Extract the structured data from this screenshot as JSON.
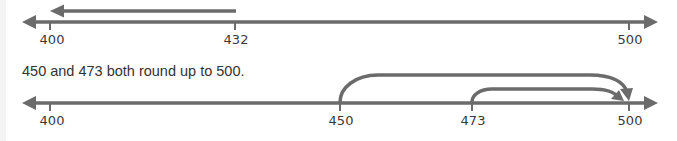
{
  "colors": {
    "line": "#6b6b6b",
    "text": "#333333",
    "label": "#3a3a3a"
  },
  "top_number_line": {
    "ticks": [
      {
        "value": "400",
        "x": 50
      },
      {
        "value": "432",
        "x": 235
      },
      {
        "value": "500",
        "x": 629
      }
    ],
    "jump_arrow": {
      "from": "432",
      "to": "400",
      "direction": "left"
    }
  },
  "caption": "450 and 473 both round up to 500.",
  "bottom_number_line": {
    "ticks": [
      {
        "value": "400",
        "x": 50
      },
      {
        "value": "450",
        "x": 340
      },
      {
        "value": "473",
        "x": 472
      },
      {
        "value": "500",
        "x": 629
      }
    ],
    "jump_arrows": [
      {
        "from": "450",
        "to": "500"
      },
      {
        "from": "473",
        "to": "500"
      }
    ]
  }
}
